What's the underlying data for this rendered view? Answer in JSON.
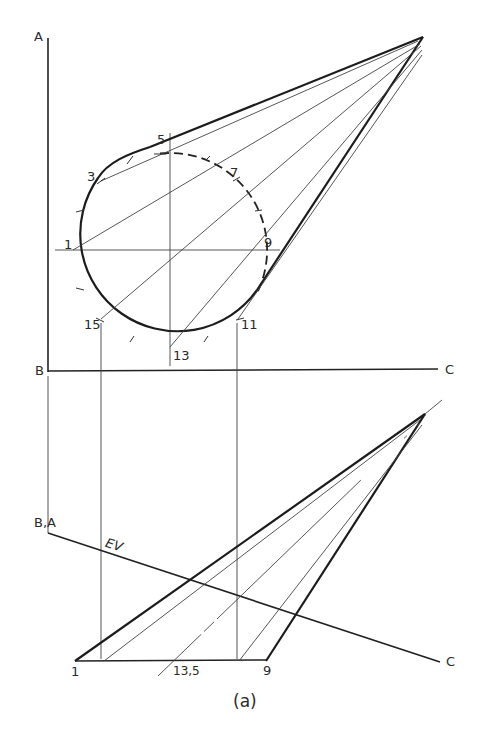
{
  "figure": {
    "caption": "(a)",
    "top_view": {
      "labels": {
        "A": "A",
        "B": "B",
        "C": "C",
        "p1": "1",
        "p3": "3",
        "p5": "5",
        "p7": "7",
        "p9": "9",
        "p11": "11",
        "p13": "13",
        "p15": "15"
      },
      "circle": {
        "cx": 170,
        "cy": 250,
        "r": 97
      },
      "apex": {
        "x": 423,
        "y": 37
      }
    },
    "edge_view": {
      "labels": {
        "BA": "B,A",
        "EV": "EV",
        "C": "C",
        "p1": "1",
        "p13_5": "13,5",
        "p9": "9"
      },
      "apex": {
        "x": 425,
        "y": 414
      }
    },
    "colors": {
      "line": "#1c1c1c",
      "background": "#ffffff"
    }
  }
}
